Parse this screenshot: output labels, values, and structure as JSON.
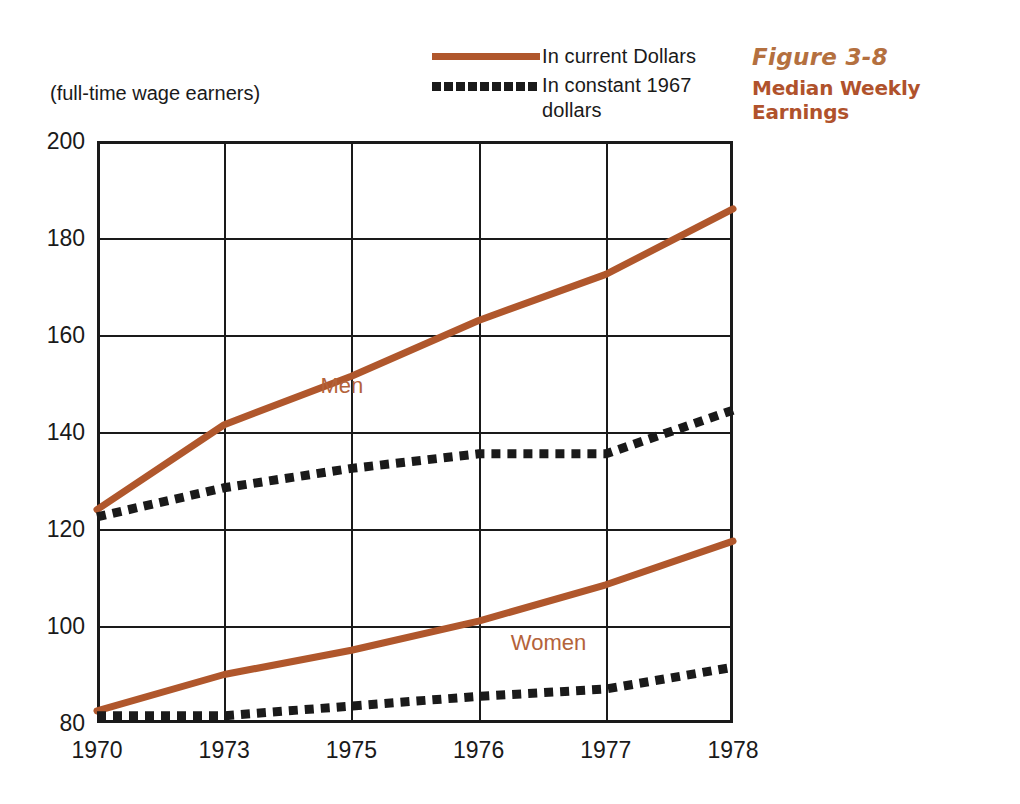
{
  "subtitle": "(full-time wage earners)",
  "figure": {
    "number": "Figure 3-8",
    "title": "Median Weekly Earnings",
    "number_color": "#b4703f",
    "title_color": "#b0522c"
  },
  "legend": {
    "items": [
      {
        "label": "In current Dollars",
        "style": "solid",
        "color": "#b0572c",
        "swatch_name": "solid-line-swatch"
      },
      {
        "label": "In constant 1967 dollars",
        "style": "dotted",
        "color": "#1a1a1a",
        "swatch_name": "dotted-line-swatch"
      }
    ]
  },
  "chart_data": {
    "type": "line",
    "title": "Median Weekly Earnings",
    "subtitle": "(full-time wage earners)",
    "xlabel": "",
    "ylabel": "",
    "categories": [
      "1970",
      "1973",
      "1975",
      "1976",
      "1977",
      "1978"
    ],
    "x": [
      1970,
      1973,
      1975,
      1976,
      1977,
      1978
    ],
    "ylim": [
      80,
      200
    ],
    "yticks": [
      80,
      100,
      120,
      140,
      160,
      180,
      200
    ],
    "grid": true,
    "legend_position": "top-center",
    "series": [
      {
        "name": "Men — In current Dollars",
        "group": "Men",
        "style": "solid",
        "color": "#b0572c",
        "values": [
          124,
          141.5,
          151.5,
          163,
          172.5,
          186
        ]
      },
      {
        "name": "Men — In constant 1967 dollars",
        "group": "Men",
        "style": "dotted",
        "color": "#1a1a1a",
        "values": [
          122.5,
          128.5,
          132.5,
          135.5,
          135.5,
          144.5
        ]
      },
      {
        "name": "Women — In current Dollars",
        "group": "Women",
        "style": "solid",
        "color": "#b0572c",
        "values": [
          82.5,
          90,
          95,
          101,
          108.5,
          117.5
        ]
      },
      {
        "name": "Women — In constant 1967 dollars",
        "group": "Women",
        "style": "dotted",
        "color": "#1a1a1a",
        "values": [
          81.5,
          81.5,
          83.5,
          85.5,
          87,
          91.5
        ]
      }
    ],
    "annotations": [
      {
        "text": "Men",
        "x": 1974.85,
        "y": 149.5,
        "color": "#b4633a"
      },
      {
        "text": "Women",
        "x": 1976.55,
        "y": 96.5,
        "color": "#b4633a"
      }
    ]
  }
}
